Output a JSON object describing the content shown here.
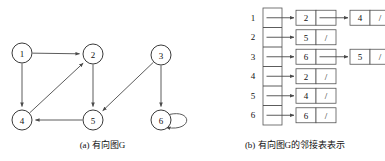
{
  "figure": {
    "title_a": "(a) 有向图G",
    "title_b": "(b) 有向图G的邻接表表示"
  },
  "graph": {
    "caption": "(a) 有向图G",
    "nodes": [
      {
        "id": "1",
        "label": "1",
        "x": 22,
        "y": 53,
        "r": 10
      },
      {
        "id": "2",
        "label": "2",
        "x": 93,
        "y": 54,
        "r": 10
      },
      {
        "id": "3",
        "label": "3",
        "x": 161,
        "y": 55,
        "r": 10
      },
      {
        "id": "4",
        "label": "4",
        "x": 22,
        "y": 120,
        "r": 10
      },
      {
        "id": "5",
        "label": "5",
        "x": 93,
        "y": 120,
        "r": 10
      },
      {
        "id": "6",
        "label": "6",
        "x": 161,
        "y": 120,
        "r": 10
      }
    ],
    "edges": [
      {
        "from": "1",
        "to": "2"
      },
      {
        "from": "1",
        "to": "4"
      },
      {
        "from": "4",
        "to": "2"
      },
      {
        "from": "2",
        "to": "5"
      },
      {
        "from": "3",
        "to": "5"
      },
      {
        "from": "3",
        "to": "6"
      },
      {
        "from": "5",
        "to": "4"
      },
      {
        "from": "6",
        "to": "6"
      }
    ]
  },
  "adjacency": {
    "caption": "(b) 有向图G的邻接表表示",
    "null_mark": "/",
    "rows": [
      {
        "index": "1",
        "cells": [
          "2",
          "4"
        ]
      },
      {
        "index": "2",
        "cells": [
          "5"
        ]
      },
      {
        "index": "3",
        "cells": [
          "6",
          "5"
        ]
      },
      {
        "index": "4",
        "cells": [
          "2"
        ]
      },
      {
        "index": "5",
        "cells": [
          "4"
        ]
      },
      {
        "index": "6",
        "cells": [
          "6"
        ]
      }
    ]
  },
  "colors": {
    "stroke": "#4a4a4a",
    "node_stroke": "#3a3a3a",
    "cell_stroke": "#555555",
    "text": "#111111",
    "background": "#ffffff"
  }
}
